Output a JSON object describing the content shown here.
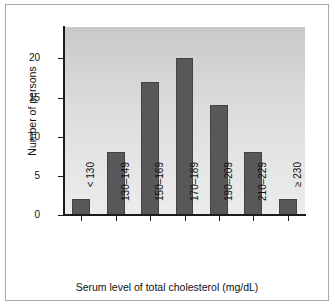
{
  "chart_data": {
    "type": "bar",
    "title": "",
    "subtitle": "",
    "xlabel": "Serum level of total cholesterol (mg/dL)",
    "ylabel": "Number of persons",
    "categories": [
      "< 130",
      "130–149",
      "150–169",
      "170–189",
      "190–209",
      "210–229",
      "≥ 230"
    ],
    "values": [
      2,
      8,
      17,
      20,
      14,
      8,
      2
    ],
    "ylim": [
      0,
      24
    ],
    "yticks": [
      0,
      5,
      10,
      15,
      20
    ],
    "ytick_labels": [
      "0",
      "5",
      "10",
      "15",
      "20"
    ],
    "grid": false,
    "legend": false,
    "annotations": [],
    "colors": {
      "bar_fill": "#58585a",
      "bar_edge": "#434345",
      "axis": "#1b1b1b",
      "text": "#111111",
      "frame": "#a8a8a8",
      "plot_background_top": "#c9c9c9",
      "plot_background_bottom": "#ececec",
      "figure_background": "#ffffff"
    }
  }
}
